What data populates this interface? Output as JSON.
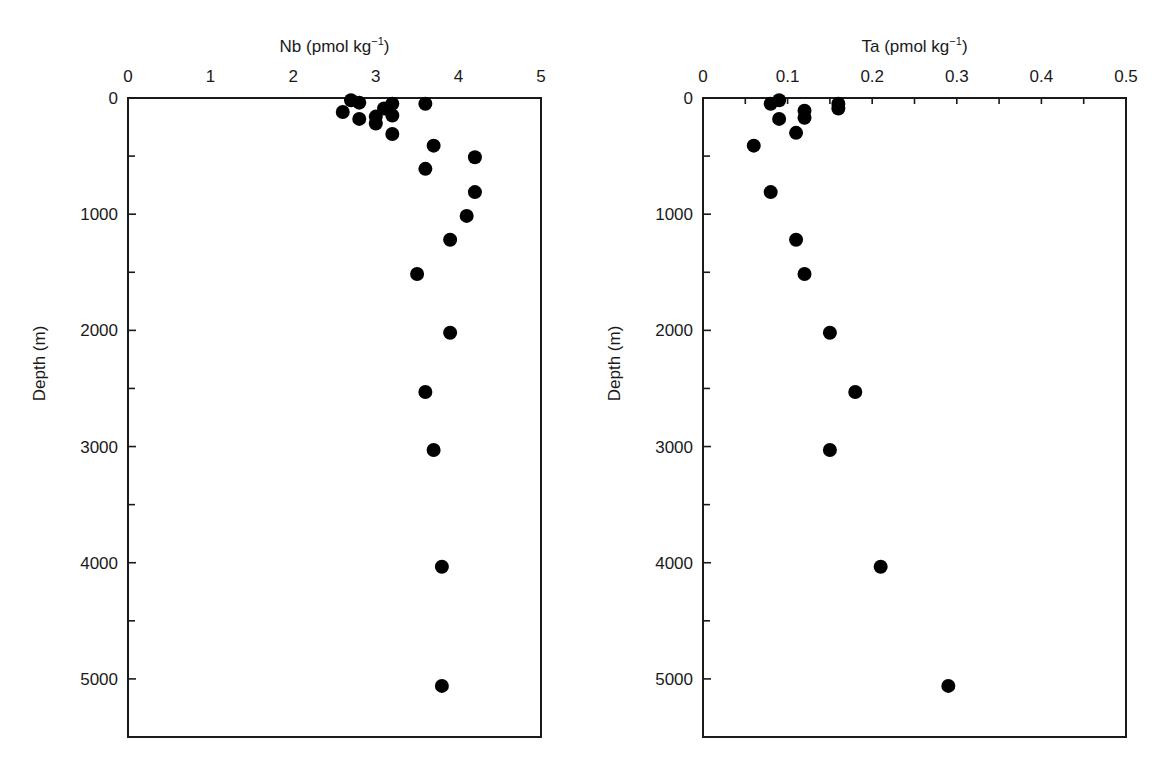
{
  "chart_data": [
    {
      "type": "scatter",
      "title": "",
      "xlabel": "Nb (pmol kg",
      "xlabel_sup": "−1",
      "xlabel_close": ")",
      "ylabel": "Depth (m)",
      "xlim": [
        0,
        5
      ],
      "ylim": [
        5500,
        0
      ],
      "x_axis_position": "top",
      "y_inverted": true,
      "xticks": [
        0,
        1,
        2,
        3,
        4,
        5
      ],
      "xticks_minor": [],
      "yticks": [
        0,
        1000,
        2000,
        3000,
        4000,
        5000
      ],
      "yticks_minor": [
        500,
        1500,
        2500,
        3500,
        4500
      ],
      "grid": false,
      "legend": null,
      "marker": "filled-circle",
      "marker_color": "#000000",
      "series": [
        {
          "name": "Nb",
          "points": [
            {
              "x": 2.7,
              "y": 20
            },
            {
              "x": 2.8,
              "y": 40
            },
            {
              "x": 2.6,
              "y": 120
            },
            {
              "x": 2.8,
              "y": 180
            },
            {
              "x": 3.0,
              "y": 160
            },
            {
              "x": 3.0,
              "y": 220
            },
            {
              "x": 3.1,
              "y": 90
            },
            {
              "x": 3.2,
              "y": 50
            },
            {
              "x": 3.2,
              "y": 150
            },
            {
              "x": 3.2,
              "y": 310
            },
            {
              "x": 3.6,
              "y": 50
            },
            {
              "x": 3.7,
              "y": 410
            },
            {
              "x": 4.2,
              "y": 510
            },
            {
              "x": 3.6,
              "y": 610
            },
            {
              "x": 4.2,
              "y": 810
            },
            {
              "x": 4.1,
              "y": 1015
            },
            {
              "x": 3.9,
              "y": 1220
            },
            {
              "x": 3.5,
              "y": 1515
            },
            {
              "x": 3.9,
              "y": 2020
            },
            {
              "x": 3.6,
              "y": 2530
            },
            {
              "x": 3.7,
              "y": 3030
            },
            {
              "x": 3.8,
              "y": 4035
            },
            {
              "x": 3.8,
              "y": 5060
            }
          ]
        }
      ]
    },
    {
      "type": "scatter",
      "title": "",
      "xlabel": "Ta (pmol kg",
      "xlabel_sup": "−1",
      "xlabel_close": ")",
      "ylabel": "Depth (m)",
      "xlim": [
        0,
        0.5
      ],
      "ylim": [
        5500,
        0
      ],
      "x_axis_position": "top",
      "y_inverted": true,
      "xticks": [
        0,
        0.1,
        0.2,
        0.3,
        0.4,
        0.5
      ],
      "xticks_minor": [
        0.05,
        0.1,
        0.15,
        0.2,
        0.25,
        0.3,
        0.35,
        0.4,
        0.45
      ],
      "yticks": [
        0,
        1000,
        2000,
        3000,
        4000,
        5000
      ],
      "yticks_minor": [
        500,
        1500,
        2500,
        3500,
        4500
      ],
      "grid": false,
      "legend": null,
      "marker": "filled-circle",
      "marker_color": "#000000",
      "series": [
        {
          "name": "Ta",
          "points": [
            {
              "x": 0.09,
              "y": 20
            },
            {
              "x": 0.08,
              "y": 50
            },
            {
              "x": 0.09,
              "y": 180
            },
            {
              "x": 0.12,
              "y": 110
            },
            {
              "x": 0.12,
              "y": 170
            },
            {
              "x": 0.11,
              "y": 300
            },
            {
              "x": 0.16,
              "y": 50
            },
            {
              "x": 0.16,
              "y": 90
            },
            {
              "x": 0.06,
              "y": 410
            },
            {
              "x": 0.08,
              "y": 810
            },
            {
              "x": 0.11,
              "y": 1220
            },
            {
              "x": 0.12,
              "y": 1515
            },
            {
              "x": 0.15,
              "y": 2020
            },
            {
              "x": 0.18,
              "y": 2530
            },
            {
              "x": 0.15,
              "y": 3030
            },
            {
              "x": 0.21,
              "y": 4035
            },
            {
              "x": 0.29,
              "y": 5060
            }
          ]
        }
      ]
    }
  ],
  "panels": [
    {
      "id": "nb",
      "frame": {
        "left": 128,
        "top": 98,
        "right": 541,
        "bottom": 737
      },
      "ylabel_x": 45
    },
    {
      "id": "ta",
      "frame": {
        "left": 703,
        "top": 98,
        "right": 1126,
        "bottom": 737
      },
      "ylabel_x": 620
    }
  ]
}
